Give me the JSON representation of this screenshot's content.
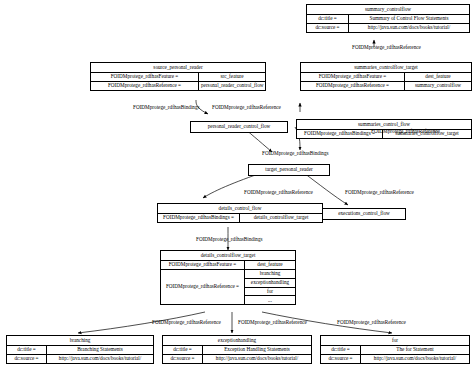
{
  "diagram": {
    "type": "rdf-object-graph"
  },
  "nodes": {
    "summary_controlflow": {
      "title": "summary_controlflow",
      "rows": [
        {
          "key": "dc:title =",
          "value": "Summary of Control Flow Statements"
        },
        {
          "key": "dc:source =",
          "value": "http://java.sun.com/docs/books/tutorial/"
        }
      ]
    },
    "source_personal_reader": {
      "title": "source_personal_reader",
      "rows": [
        {
          "key": "FOIDMprotege_rdfhasFeature =",
          "value": "src_feature"
        },
        {
          "key": "FOIDMprotege_rdfhasReference =",
          "value": "personal_reader_control_flow"
        }
      ]
    },
    "summaries_controlflow_target": {
      "title": "summaries_controlflow_target",
      "rows": [
        {
          "key": "FOIDMprotege_rdfhasFeature =",
          "value": "dest_feature"
        },
        {
          "key": "FOIDMprotege_rdfhasReference =",
          "value": "summary_controlflow"
        }
      ]
    },
    "personal_reader_control_flow": {
      "title": "personal_reader_control_flow",
      "rows": []
    },
    "summaries_control_flow": {
      "title": "summaries_control_flow",
      "rows": [
        {
          "key": "FOIDMprotege_rdfhasBindings =",
          "value": "summaries_controlflow_target"
        }
      ]
    },
    "target_personal_reader": {
      "title": "target_personal_reader",
      "rows": []
    },
    "details_control_flow": {
      "title": "details_control_flow",
      "rows": [
        {
          "key": "FOIDMprotege_rdfhasBindings =",
          "value": "details_controlflow_target"
        }
      ]
    },
    "executions_control_flow": {
      "title": "executions_control_flow",
      "rows": []
    },
    "details_controlflow_target": {
      "title": "details_controlflow_target",
      "rows": [
        {
          "key": "FOIDMprotege_rdfhasFeature =",
          "value": "dest_feature"
        }
      ],
      "multi_row": {
        "key": "FOIDMprotege_rdfhasReference =",
        "values": [
          "branching",
          "exceptionhandling",
          "for",
          "..."
        ]
      }
    },
    "branching": {
      "title": "branching",
      "rows": [
        {
          "key": "dc:title =",
          "value": "Branching Statements"
        },
        {
          "key": "dc:source =",
          "value": "http://java.sun.com/docs/books/tutorial/"
        }
      ]
    },
    "exceptionhandling": {
      "title": "exceptionhandling",
      "rows": [
        {
          "key": "dc:title =",
          "value": "Exception Handling Statements"
        },
        {
          "key": "dc:source =",
          "value": "http://java.sun.com/docs/books/tutorial/"
        }
      ]
    },
    "for": {
      "title": "for",
      "rows": [
        {
          "key": "dc:title =",
          "value": "The for Statement"
        },
        {
          "key": "dc:source =",
          "value": "http://java.sun.com/docs/books/tutorial/"
        }
      ]
    }
  },
  "edge_labels": {
    "e1": "FOIDMprotege_rdfhasReference",
    "e2": "FOIDMprotege_rdfhasBindings",
    "e3": "FOIDMprotege_rdfhasReference",
    "e4": "FOIDMprotege_rdfhasBindings",
    "e5": "FOIDMprotege_rdfhasReference",
    "e6": "FOIDMprotege_rdfhasReference",
    "e7": "FOIDMprotege_rdfhasReference",
    "e8": "FOIDMprotege_rdfhasBindings",
    "e9": "FOIDMprotege_rdfhasReference",
    "e10": "FOIDMprotege_rdfhasReference",
    "e11": "FOIDMprotege_rdfhasReference"
  }
}
